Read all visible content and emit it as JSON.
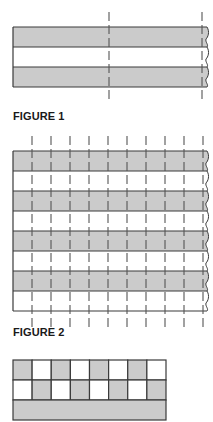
{
  "colors": {
    "fill_gray": "#cbcbcb",
    "fill_white": "#ffffff",
    "stroke": "#3a3a3a",
    "dash": "#555555"
  },
  "figures": [
    {
      "id": "figure-1",
      "label": "FIGURE 1",
      "label_y": 110,
      "box": {
        "x": 13,
        "y": 27,
        "right": 207,
        "row_height": 20
      },
      "rows": [
        "gray",
        "white",
        "gray"
      ],
      "right_edge": "break-line",
      "dashed_lines_x": [
        109,
        202
      ],
      "dashed_extent": [
        12,
        103
      ]
    },
    {
      "id": "figure-2",
      "label": "FIGURE 2",
      "label_y": 326,
      "box": {
        "x": 13,
        "y": 151,
        "right": 207,
        "row_height": 20
      },
      "rows": [
        "gray",
        "white",
        "gray",
        "white",
        "gray",
        "white",
        "gray",
        "white"
      ],
      "right_edge": "break-line",
      "dashed_lines_x": [
        32,
        51,
        70,
        89,
        108,
        127,
        146,
        165,
        184,
        203
      ],
      "dashed_extent": [
        136,
        327
      ]
    },
    {
      "id": "figure-3",
      "label": "",
      "box": {
        "x": 13,
        "y": 360,
        "right": 166,
        "row_height": 20
      },
      "columns": 8,
      "rows": [
        [
          "gray",
          "white",
          "gray",
          "white",
          "gray",
          "white",
          "gray",
          "white"
        ],
        [
          "white",
          "gray",
          "white",
          "gray",
          "white",
          "gray",
          "white",
          "gray"
        ],
        [
          "gray-full"
        ]
      ]
    }
  ]
}
